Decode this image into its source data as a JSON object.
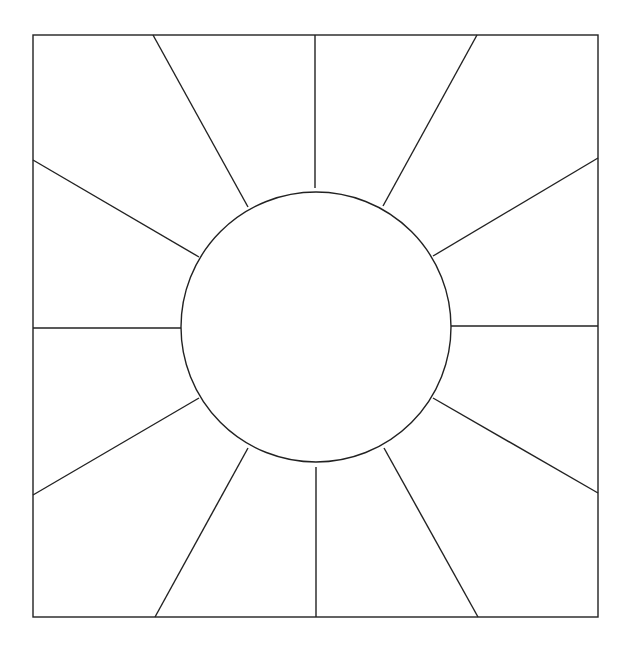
{
  "diagram": {
    "stroke_color": "#222222",
    "background": "#ffffff",
    "frame": {
      "x": 33,
      "y": 35,
      "width": 565,
      "height": 582
    },
    "circle": {
      "cx": 316,
      "cy": 327,
      "r": 135
    },
    "rays": [
      {
        "x1": 153,
        "y1": 35,
        "x2": 248,
        "y2": 207
      },
      {
        "x1": 315,
        "y1": 35,
        "x2": 315,
        "y2": 188
      },
      {
        "x1": 477,
        "y1": 35,
        "x2": 383,
        "y2": 206
      },
      {
        "x1": 598,
        "y1": 158,
        "x2": 433,
        "y2": 256
      },
      {
        "x1": 598,
        "y1": 326,
        "x2": 451,
        "y2": 326
      },
      {
        "x1": 598,
        "y1": 493,
        "x2": 433,
        "y2": 398
      },
      {
        "x1": 478,
        "y1": 617,
        "x2": 384,
        "y2": 448
      },
      {
        "x1": 316,
        "y1": 617,
        "x2": 316,
        "y2": 467
      },
      {
        "x1": 155,
        "y1": 617,
        "x2": 248,
        "y2": 448
      },
      {
        "x1": 33,
        "y1": 495,
        "x2": 199,
        "y2": 398
      },
      {
        "x1": 33,
        "y1": 328,
        "x2": 181,
        "y2": 328
      },
      {
        "x1": 33,
        "y1": 160,
        "x2": 199,
        "y2": 257
      }
    ]
  }
}
